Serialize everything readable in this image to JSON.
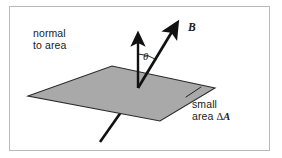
{
  "figure": {
    "kind": "physics-vector-diagram",
    "background_color": "#ffffff",
    "frame_color": "#b9b9b9"
  },
  "labels": {
    "normal_line1": "normal",
    "normal_line2": "to area",
    "b_vector": "B",
    "theta": "θ",
    "small_area_line1": "small",
    "small_area_line2_prefix": "area ",
    "small_area_delta": "Δ",
    "small_area_symbol": "A"
  },
  "geometry": {
    "plane": {
      "name": "area-element-parallelogram",
      "fill_color": "#a9a9a9",
      "stroke_color": "#2b2b2b",
      "vertices": [
        {
          "x": 28,
          "y": 96
        },
        {
          "x": 112,
          "y": 66
        },
        {
          "x": 215,
          "y": 88
        },
        {
          "x": 160,
          "y": 121
        }
      ]
    },
    "normal_vector": {
      "name": "normal-to-area-arrow",
      "color": "#111111",
      "from": {
        "x": 138,
        "y": 88
      },
      "to": {
        "x": 138,
        "y": 37
      }
    },
    "b_vector": {
      "name": "magnetic-field-arrow",
      "color": "#111111",
      "tail": {
        "x": 100,
        "y": 142
      },
      "origin": {
        "x": 138,
        "y": 88
      },
      "tip": {
        "x": 177,
        "y": 24
      }
    },
    "angle_arc": {
      "name": "theta-angle-arc",
      "color": "#111111",
      "center": {
        "x": 138,
        "y": 88
      },
      "radius": 34,
      "start_deg": 90,
      "end_deg": 58
    }
  },
  "colors": {
    "plane_fill": "#a9a9a9",
    "ink": "#111111",
    "frame": "#b9b9b9",
    "page": "#ffffff"
  }
}
